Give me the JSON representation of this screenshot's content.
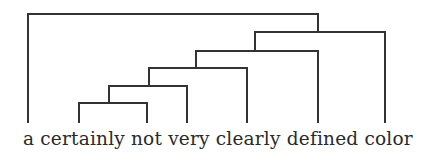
{
  "diagram": {
    "type": "dendrogram",
    "line_color": "#333333",
    "line_width": 2,
    "caption": "a certainly not very clearly defined color",
    "leaves": [
      {
        "word": "a",
        "x": 28
      },
      {
        "word": "certainly",
        "x": 79
      },
      {
        "word": "not",
        "x": 147
      },
      {
        "word": "very",
        "x": 187
      },
      {
        "word": "clearly",
        "x": 247
      },
      {
        "word": "defined",
        "x": 318
      },
      {
        "word": "color",
        "x": 385
      }
    ],
    "leaf_bottom_y": 122,
    "merges": [
      {
        "left_x": 79,
        "right_x": 147,
        "y": 103,
        "joins": [
          "certainly",
          "not"
        ]
      },
      {
        "left_x": 109,
        "right_x": 187,
        "y": 86,
        "joins": [
          "(certainly not)",
          "very"
        ]
      },
      {
        "left_x": 149,
        "right_x": 247,
        "y": 68,
        "joins": [
          "(certainly not very)",
          "clearly"
        ]
      },
      {
        "left_x": 196,
        "right_x": 318,
        "y": 51,
        "joins": [
          "(certainly not very clearly)",
          "defined"
        ]
      },
      {
        "left_x": 255,
        "right_x": 385,
        "y": 32,
        "joins": [
          "(certainly not very clearly defined)",
          "color"
        ]
      },
      {
        "left_x": 28,
        "right_x": 318,
        "y": 14,
        "joins": [
          "a",
          "(certainly not very clearly defined color)"
        ]
      }
    ]
  }
}
